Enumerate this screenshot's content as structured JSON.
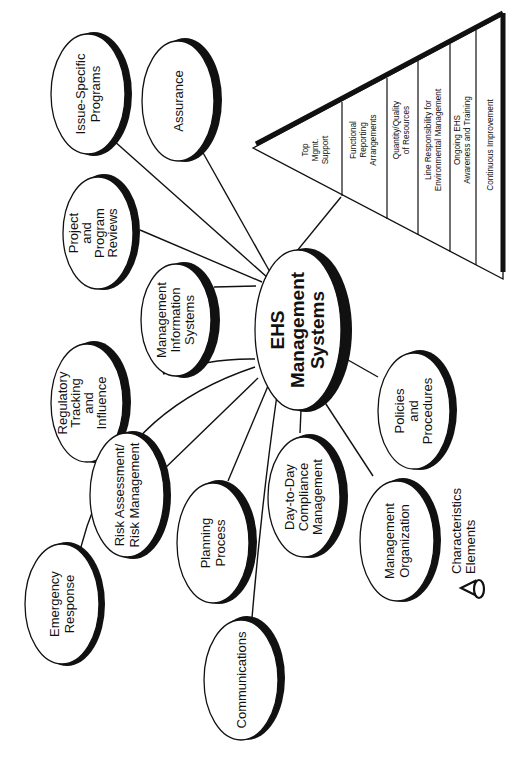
{
  "diagram": {
    "center": {
      "lines": [
        "EHS",
        "Management",
        "Systems"
      ]
    },
    "elements": [
      {
        "id": "issue-specific-programs",
        "lines": [
          "Issue-Specific",
          "Programs"
        ]
      },
      {
        "id": "assurance",
        "lines": [
          "Assurance"
        ]
      },
      {
        "id": "project-program-reviews",
        "lines": [
          "Project",
          "and",
          "Program",
          "Reviews"
        ]
      },
      {
        "id": "management-information-systems",
        "lines": [
          "Management",
          "Information",
          "Systems"
        ]
      },
      {
        "id": "regulatory-tracking",
        "lines": [
          "Regulatory",
          "Tracking",
          "and",
          "Influence"
        ]
      },
      {
        "id": "risk-assessment",
        "lines": [
          "Risk Assessment/",
          "Risk Management"
        ]
      },
      {
        "id": "emergency-response",
        "lines": [
          "Emergency",
          "Response"
        ]
      },
      {
        "id": "planning-process",
        "lines": [
          "Planning",
          "Process"
        ]
      },
      {
        "id": "communications",
        "lines": [
          "Communications"
        ]
      },
      {
        "id": "day-to-day-compliance",
        "lines": [
          "Day-to-Day",
          "Compliance",
          "Management"
        ]
      },
      {
        "id": "management-organization",
        "lines": [
          "Management",
          "Organization"
        ]
      },
      {
        "id": "policies-procedures",
        "lines": [
          "Policies",
          "and",
          "Procedures"
        ]
      }
    ],
    "characteristics": [
      {
        "lines": [
          "Top",
          "Mgmt.",
          "Support"
        ]
      },
      {
        "lines": [
          "Functional",
          "Reporting",
          "Arrangements"
        ]
      },
      {
        "lines": [
          "Quantity/Quality",
          "of Resources"
        ]
      },
      {
        "lines": [
          "Line Responsibility for",
          "Environmental Management"
        ]
      },
      {
        "lines": [
          "Ongoing EHS",
          "Awareness and Training"
        ]
      },
      {
        "lines": [
          "Continuous Improvement"
        ]
      }
    ],
    "legend": {
      "characteristics_label": "Characteristics",
      "elements_label": "Elements"
    }
  }
}
